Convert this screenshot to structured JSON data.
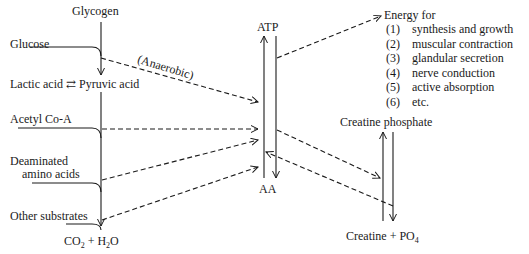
{
  "diagram": {
    "left_column": {
      "glycogen": "Glycogen",
      "glucose": "Glucose",
      "lactic_acid": "Lactic acid",
      "reversible_symbol": "⇄",
      "pyruvic_acid": "Pyruvic acid",
      "acetyl_coa": "Acetyl Co-A",
      "deaminated_line1": "Deaminated",
      "deaminated_line2": "amino acids",
      "other_substrates": "Other substrates",
      "end_product_co2": "CO",
      "end_product_co2_sub": "2",
      "end_product_plus": " + H",
      "end_product_h2o_sub": "2",
      "end_product_o": "O"
    },
    "anaerobic_label": "(Anaerobic)",
    "center": {
      "atp": "ATP",
      "aa": "AA"
    },
    "energy": {
      "heading": "Energy for",
      "items": [
        {
          "num": "(1)",
          "text": "synthesis and growth"
        },
        {
          "num": "(2)",
          "text": "muscular contraction"
        },
        {
          "num": "(3)",
          "text": "glandular secretion"
        },
        {
          "num": "(4)",
          "text": "nerve conduction"
        },
        {
          "num": "(5)",
          "text": "active absorption"
        },
        {
          "num": "(6)",
          "text": "etc."
        }
      ]
    },
    "creatine": {
      "phosphate": "Creatine phosphate",
      "creatine": "Creatine + PO",
      "po4_sub": "4"
    },
    "colors": {
      "line": "#1a1a1a",
      "background": "#ffffff"
    }
  }
}
